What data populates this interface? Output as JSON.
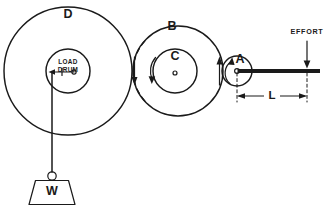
{
  "diagram": {
    "background_color": "#ffffff",
    "line_color": "#1a1a1a",
    "wheels": [
      {
        "id": "D",
        "label": "D",
        "role": "large-load-wheel",
        "cx": 68,
        "cy": 71,
        "r": 64,
        "label_x": 68,
        "label_y": 15
      },
      {
        "id": "B",
        "label": "B",
        "role": "intermediate-wheel",
        "cx": 178,
        "cy": 71,
        "r": 45,
        "label_x": 172,
        "label_y": 27
      },
      {
        "id": "C",
        "label": "C",
        "role": "intermediate-axle",
        "cx": 175,
        "cy": 71,
        "r": 22,
        "label_x": 175,
        "label_y": 57
      },
      {
        "id": "A",
        "label": "A",
        "role": "effort-wheel",
        "cx": 237,
        "cy": 71,
        "r": 15,
        "label_x": 240,
        "label_y": 60
      }
    ],
    "load_drum": {
      "label_line1": "LOAD",
      "label_line2": "DRUM",
      "cx": 68,
      "cy": 71,
      "r": 22,
      "tension_label": "T"
    },
    "weight": {
      "label": "W",
      "shape": "trapezoid",
      "cx": 52,
      "cy": 190
    },
    "effort": {
      "label": "EFFORT",
      "label_x": 307,
      "label_y": 36,
      "arrow_x": 307,
      "applied_y": 71
    },
    "dimension": {
      "label": "L",
      "from_x": 237,
      "to_x": 307,
      "y": 96,
      "description": "lever arm length from wheel A centre to effort"
    },
    "rotation_arrows": [
      {
        "name": "drum-tension-arrow",
        "direction": "left",
        "x": 52,
        "y": 71
      },
      {
        "name": "wheel-d-b-tangent-arrow",
        "direction": "down",
        "x": 135,
        "y": 71
      },
      {
        "name": "wheel-c-arrow",
        "direction": "down-curved",
        "x": 152,
        "y": 71
      },
      {
        "name": "wheel-b-right-arrow",
        "direction": "up",
        "x": 219,
        "y": 71
      },
      {
        "name": "wheel-a-left-arrow",
        "direction": "up-curved",
        "x": 228,
        "y": 71
      }
    ]
  }
}
